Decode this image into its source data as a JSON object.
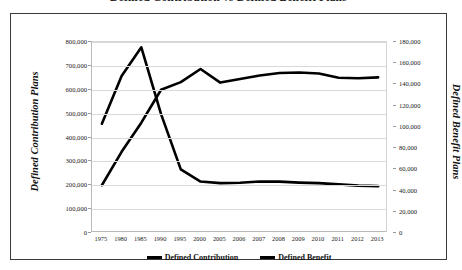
{
  "chart_data": {
    "type": "line",
    "title": "Defined Contribution vs Defined Benefit Plans",
    "xlabel": "",
    "grid": true,
    "legend_position": "bottom",
    "categories": [
      "1975",
      "1980",
      "1985",
      "1990",
      "1995",
      "2000",
      "2005",
      "2006",
      "2007",
      "2008",
      "2009",
      "2010",
      "2011",
      "2012",
      "2013"
    ],
    "axes": {
      "left": {
        "label": "Defined Contribution Plans",
        "ylim": [
          0,
          800000
        ],
        "ticks": [
          "0",
          "100,000",
          "200,000",
          "300,000",
          "400,000",
          "500,000",
          "600,000",
          "700,000",
          "800,000"
        ],
        "tick_values": [
          0,
          100000,
          200000,
          300000,
          400000,
          500000,
          600000,
          700000,
          800000
        ]
      },
      "right": {
        "label": "Defined Benefit Plans",
        "ylim": [
          0,
          180000
        ],
        "ticks": [
          "0",
          "20,000",
          "40,000",
          "60,000",
          "80,000",
          "100,000",
          "120,000",
          "140,000",
          "160,000",
          "180,000"
        ],
        "tick_values": [
          0,
          20000,
          40000,
          60000,
          80000,
          100000,
          120000,
          140000,
          160000,
          180000
        ]
      }
    },
    "series": [
      {
        "name": "Defined Contribution",
        "axis": "left",
        "color": "#000000",
        "values": [
          200000,
          340000,
          462000,
          600000,
          632000,
          687000,
          630000,
          645000,
          660000,
          670000,
          672000,
          668000,
          650000,
          648000,
          652000
        ]
      },
      {
        "name": "Defined Benefit",
        "axis": "right",
        "color": "#000000",
        "values": [
          103000,
          148000,
          175000,
          112000,
          60000,
          48500,
          47000,
          47300,
          48600,
          48400,
          47500,
          47000,
          45800,
          44600,
          44200
        ]
      }
    ]
  },
  "legend": {
    "items": [
      {
        "label": "Defined Contribution"
      },
      {
        "label": "Defined Benefit"
      }
    ]
  }
}
